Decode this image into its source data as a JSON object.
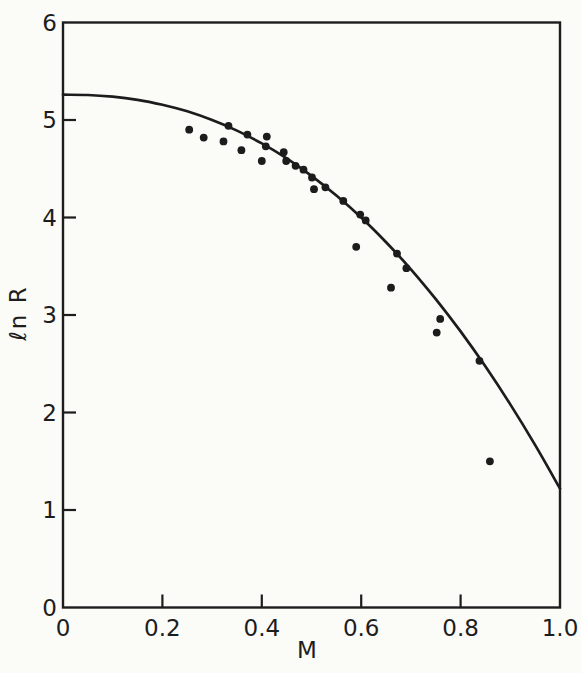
{
  "figure": {
    "background": "#fbfbf8",
    "ink": "#1d1d1d"
  },
  "chart_data": {
    "type": "scatter",
    "title": "",
    "xlabel": "M",
    "ylabel": "ℓn R",
    "grid": false,
    "legend": null,
    "x_axis": {
      "label": "M",
      "range": [
        0,
        1.0
      ],
      "tick_values": [
        0,
        0.2,
        0.4,
        0.6,
        0.8,
        1.0
      ],
      "tick_labels": [
        "0",
        "0.2",
        "0.4",
        "0.6",
        "0.8",
        "1.0"
      ],
      "ticks_with_marks": [
        0.2,
        0.4,
        0.6,
        0.8
      ]
    },
    "y_axis": {
      "label": "ℓn R",
      "range": [
        0,
        6
      ],
      "tick_values": [
        0,
        1,
        2,
        3,
        4,
        5,
        6
      ],
      "tick_labels": [
        "0",
        "1",
        "2",
        "3",
        "4",
        "5",
        "6"
      ],
      "ticks_with_marks": [
        1,
        2,
        3,
        4,
        5
      ]
    },
    "series": [
      {
        "name": "observed-points",
        "type": "scatter",
        "marker": "filled-circle",
        "points": [
          [
            0.254,
            4.9
          ],
          [
            0.283,
            4.82
          ],
          [
            0.333,
            4.94
          ],
          [
            0.323,
            4.78
          ],
          [
            0.371,
            4.85
          ],
          [
            0.359,
            4.69
          ],
          [
            0.41,
            4.83
          ],
          [
            0.408,
            4.73
          ],
          [
            0.4,
            4.58
          ],
          [
            0.444,
            4.67
          ],
          [
            0.449,
            4.58
          ],
          [
            0.468,
            4.53
          ],
          [
            0.484,
            4.49
          ],
          [
            0.501,
            4.41
          ],
          [
            0.505,
            4.29
          ],
          [
            0.528,
            4.31
          ],
          [
            0.564,
            4.17
          ],
          [
            0.598,
            4.03
          ],
          [
            0.609,
            3.97
          ],
          [
            0.59,
            3.7
          ],
          [
            0.672,
            3.63
          ],
          [
            0.691,
            3.48
          ],
          [
            0.66,
            3.28
          ],
          [
            0.759,
            2.96
          ],
          [
            0.752,
            2.82
          ],
          [
            0.838,
            2.53
          ],
          [
            0.859,
            1.5
          ]
        ]
      },
      {
        "name": "fitted-curve",
        "type": "line",
        "points": [
          [
            0.0,
            5.26
          ],
          [
            0.05,
            5.256
          ],
          [
            0.1,
            5.239
          ],
          [
            0.15,
            5.207
          ],
          [
            0.2,
            5.157
          ],
          [
            0.25,
            5.089
          ],
          [
            0.3,
            5.0
          ],
          [
            0.35,
            4.891
          ],
          [
            0.4,
            4.76
          ],
          [
            0.45,
            4.606
          ],
          [
            0.5,
            4.428
          ],
          [
            0.55,
            4.226
          ],
          [
            0.6,
            4.0
          ],
          [
            0.65,
            3.747
          ],
          [
            0.7,
            3.469
          ],
          [
            0.75,
            3.163
          ],
          [
            0.8,
            2.832
          ],
          [
            0.85,
            2.471
          ],
          [
            0.9,
            2.083
          ],
          [
            0.95,
            1.666
          ],
          [
            1.0,
            1.22
          ]
        ]
      }
    ]
  }
}
